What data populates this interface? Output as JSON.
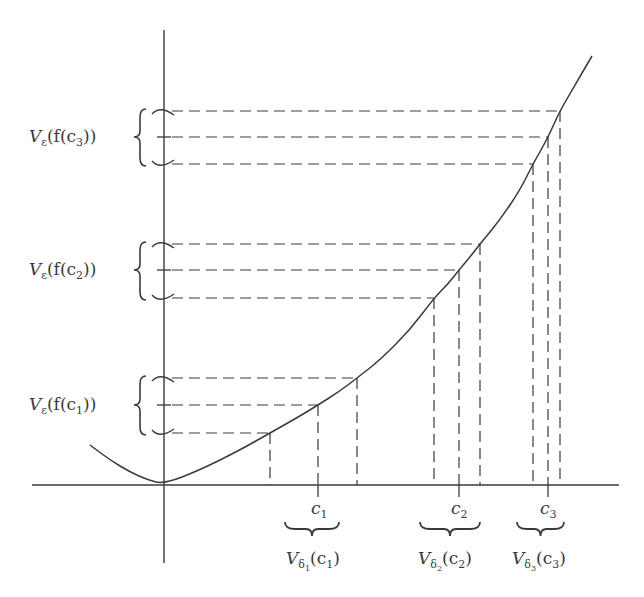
{
  "diagram": {
    "colors": {
      "ink": "#3a3a3a",
      "background": "#ffffff"
    },
    "axes": {
      "x_axis": {
        "from": [
          32,
          485
        ],
        "to": [
          619,
          485
        ]
      },
      "y_axis": {
        "from": [
          164,
          30
        ],
        "to": [
          164,
          563
        ]
      },
      "origin": [
        164,
        484
      ]
    },
    "curve": {
      "description": "Convex function with minimum at origin",
      "points": [
        [
          90,
          445
        ],
        [
          110,
          460
        ],
        [
          130,
          472
        ],
        [
          148,
          480
        ],
        [
          164,
          484
        ],
        [
          200,
          470
        ],
        [
          240,
          450
        ],
        [
          270,
          433
        ],
        [
          300,
          416
        ],
        [
          318,
          405
        ],
        [
          340,
          391
        ],
        [
          357,
          378
        ],
        [
          380,
          360
        ],
        [
          410,
          330
        ],
        [
          434,
          298
        ],
        [
          448,
          284
        ],
        [
          459,
          270
        ],
        [
          470,
          257
        ],
        [
          480,
          244
        ],
        [
          500,
          220
        ],
        [
          520,
          190
        ],
        [
          533,
          164
        ],
        [
          541,
          150
        ],
        [
          548,
          137
        ],
        [
          554,
          124
        ],
        [
          560,
          111
        ],
        [
          575,
          85
        ],
        [
          592,
          56
        ]
      ]
    },
    "groups": [
      {
        "id": "c1",
        "point_label": "c",
        "point_sub": "1",
        "x_left": 270,
        "x_center": 318,
        "x_right": 357,
        "y_low": 433,
        "y_center": 405,
        "y_high": 378,
        "epsilon_label": {
          "prefix": "V",
          "sub": "ε",
          "body_open": "(f(c",
          "body_sub": "1",
          "body_close": "))"
        },
        "delta_label": {
          "prefix": "V",
          "sub": "δ",
          "subsub": "1",
          "body_open": "(c",
          "body_sub": "1",
          "body_close": ")"
        }
      },
      {
        "id": "c2",
        "point_label": "c",
        "point_sub": "2",
        "x_left": 434,
        "x_center": 459,
        "x_right": 480,
        "y_low": 298,
        "y_center": 270,
        "y_high": 244,
        "epsilon_label": {
          "prefix": "V",
          "sub": "ε",
          "body_open": "(f(c",
          "body_sub": "2",
          "body_close": "))"
        },
        "delta_label": {
          "prefix": "V",
          "sub": "δ",
          "subsub": "2",
          "body_open": "(c",
          "body_sub": "2",
          "body_close": ")"
        }
      },
      {
        "id": "c3",
        "point_label": "c",
        "point_sub": "3",
        "x_left": 533,
        "x_center": 548,
        "x_right": 560,
        "y_low": 164,
        "y_center": 137,
        "y_high": 111,
        "epsilon_label": {
          "prefix": "V",
          "sub": "ε",
          "body_open": "(f(c",
          "body_sub": "3",
          "body_close": "))"
        },
        "delta_label": {
          "prefix": "V",
          "sub": "δ",
          "subsub": "3",
          "body_open": "(c",
          "body_sub": "3",
          "body_close": ")"
        }
      }
    ]
  }
}
